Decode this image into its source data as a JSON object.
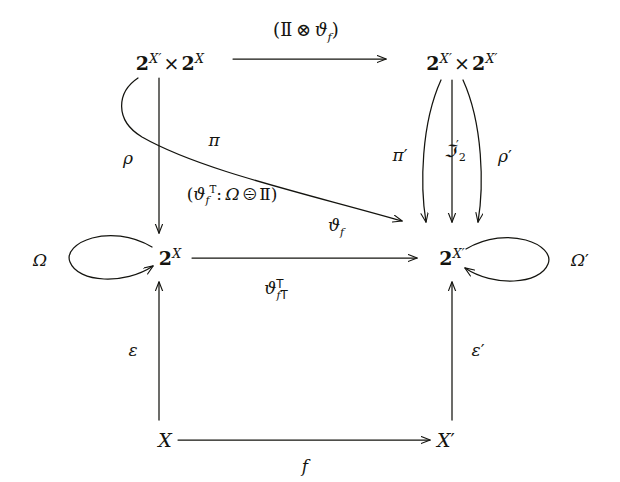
{
  "diagram": {
    "kind": "commutative-diagram",
    "background": "#ffffff",
    "ink": "#14140f",
    "nodes": {
      "top_left": "2^{X'} × 2^{X}",
      "top_right": "2^{X'} × 2^{X'}",
      "mid_left": "2^{X}",
      "mid_right": "2^{X'}",
      "bottom_left": "X",
      "bottom_right": "X'"
    },
    "labels": {
      "top_arrow": "(II ⊗ ϑ_f)",
      "rho": "ρ",
      "pi": "π",
      "paren_theta": "(ϑ_{fᵀ} : Ω ⊘ II)",
      "pi_prime": "π′",
      "J2_prime": "ℑ′₂",
      "rho_prime": "ρ′",
      "theta_f": "ϑ_f",
      "theta_f_T": "ϑ^T_{fᵀ}",
      "omega": "Ω",
      "omega_prime": "Ω′",
      "epsilon": "ε",
      "epsilon_prime": "ε′",
      "f": "f"
    },
    "symbols": {
      "otimes": "⊗",
      "oslash_gt": "⊘",
      "blackboard_I": "II",
      "prime": "′",
      "transpose": "T"
    },
    "edges": [
      {
        "name": "top-arrow",
        "from": "top_left",
        "to": "top_right",
        "style": "straight",
        "label": "top_arrow"
      },
      {
        "name": "pi-edge",
        "from": "top_left",
        "to": "mid_left",
        "style": "straight-down",
        "label": "pi"
      },
      {
        "name": "rho-edge",
        "from": "top_left",
        "to": "mid_right",
        "style": "curved-sweep",
        "label": "rho"
      },
      {
        "name": "pi-prime-edge",
        "from": "top_right",
        "to": "mid_right",
        "style": "curved-left",
        "label": "pi_prime"
      },
      {
        "name": "j2-prime-edge",
        "from": "top_right",
        "to": "mid_right",
        "style": "straight-down",
        "label": "J2_prime"
      },
      {
        "name": "rho-prime-edge",
        "from": "top_right",
        "to": "mid_right",
        "style": "curved-right",
        "label": "rho_prime"
      },
      {
        "name": "theta-f-edge",
        "from": "mid_left",
        "to": "mid_right",
        "style": "straight",
        "label": "theta_f"
      },
      {
        "name": "omega-loop",
        "at": "mid_left",
        "style": "self-loop-left",
        "label": "omega"
      },
      {
        "name": "omega-prime-loop",
        "at": "mid_right",
        "style": "self-loop-right",
        "label": "omega_prime"
      },
      {
        "name": "epsilon-edge",
        "from": "bottom_left",
        "to": "mid_left",
        "style": "straight-up",
        "label": "epsilon"
      },
      {
        "name": "epsilon-prime-edge",
        "from": "bottom_right",
        "to": "mid_right",
        "style": "straight-up",
        "label": "epsilon_prime"
      },
      {
        "name": "f-edge",
        "from": "bottom_left",
        "to": "bottom_right",
        "style": "straight",
        "label": "f"
      }
    ]
  }
}
